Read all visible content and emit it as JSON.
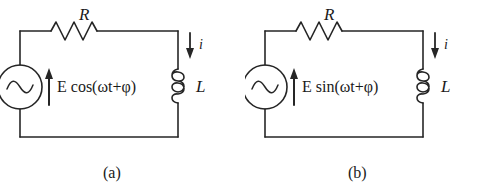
{
  "figure": {
    "background_color": "#ffffff",
    "line_color": "#262626",
    "text_color": "#1a1a1a",
    "width": 490,
    "height": 196
  },
  "panels": [
    {
      "id": "a",
      "caption": "(a)",
      "resistor_label": "R",
      "inductor_label": "L",
      "current_label": "i",
      "source_expression": "E cos(ωt+φ)",
      "source_function": "cos",
      "source_amplitude": "E",
      "source_angular_frequency": "ω",
      "source_time_variable": "t",
      "source_phase": "φ",
      "source_type": "ac-voltage-source",
      "current_direction": "down",
      "source_arrow_direction": "up"
    },
    {
      "id": "b",
      "caption": "(b)",
      "resistor_label": "R",
      "inductor_label": "L",
      "current_label": "i",
      "source_expression": "E sin(ωt+φ)",
      "source_function": "sin",
      "source_amplitude": "E",
      "source_angular_frequency": "ω",
      "source_time_variable": "t",
      "source_phase": "φ",
      "source_type": "ac-voltage-source",
      "current_direction": "down",
      "source_arrow_direction": "up"
    }
  ]
}
